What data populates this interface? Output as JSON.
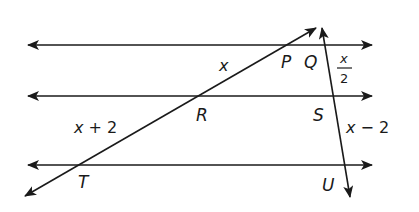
{
  "diagram": {
    "points": {
      "P": "P",
      "Q": "Q",
      "R": "R",
      "S": "S",
      "T": "T",
      "U": "U"
    },
    "segment_labels": {
      "PR": {
        "var": "x",
        "rest": ""
      },
      "RT": {
        "var": "x",
        "rest": " + 2"
      },
      "QS": {
        "numerator": "x",
        "denominator": "2"
      },
      "SU": {
        "var": "x",
        "rest": " − 2"
      }
    },
    "colors": {
      "stroke": "#1a1a1a",
      "background": "#ffffff"
    }
  }
}
